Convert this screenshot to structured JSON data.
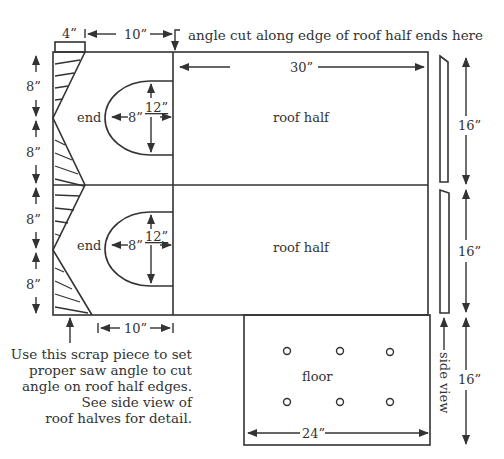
{
  "diagram": {
    "type": "cutting-layout",
    "units": "inches",
    "colors": {
      "line": "#333333",
      "text": "#333333",
      "background": "#ffffff"
    },
    "annotations": {
      "top_note": "angle cut along edge of roof half ends here",
      "scrap_note": [
        "Use this scrap piece to set",
        "proper saw angle to cut",
        "angle on roof half edges.",
        "See side view of",
        "roof halves for detail."
      ],
      "side_view_label": "side view"
    },
    "parts": {
      "end_top": "end",
      "end_bottom": "end",
      "roof_half_top": "roof half",
      "roof_half_bottom": "roof half",
      "floor": "floor"
    },
    "dimensions": {
      "scrap_width": "4”",
      "end_width_top": "10”",
      "roof_length": "30”",
      "left_8_1": "8”",
      "left_8_2": "8”",
      "left_8_3": "8”",
      "left_8_4": "8”",
      "arch_top_depth": "8”",
      "arch_top_height": "12”",
      "arch_bottom_depth": "8”",
      "arch_bottom_height": "12”",
      "end_width_bottom": "10”",
      "right_16_top": "16”",
      "right_16_middle": "16”",
      "right_16_floor": "16”",
      "floor_width": "24”"
    },
    "floor_holes": {
      "count": 6,
      "rows": 2,
      "cols": 3
    }
  }
}
